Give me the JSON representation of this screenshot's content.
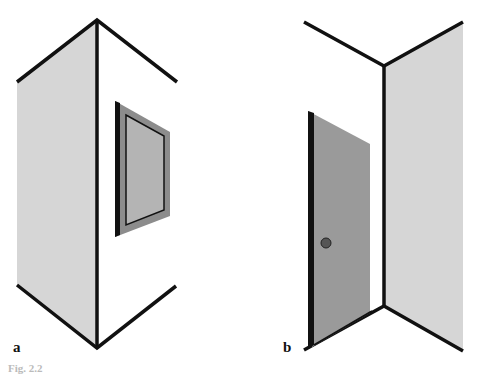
{
  "figure": {
    "panels": [
      {
        "label": "a",
        "description": "Outside corner of a wall with a picture frame hanging on the right wall"
      },
      {
        "label": "b",
        "description": "Inside corner of a room with an open door on the left"
      }
    ],
    "caption_partial": "Fig. 2.2"
  },
  "colors": {
    "line": "#111111",
    "wall_fill": "#d6d6d6",
    "frame_fill": "#8c8c8c",
    "picture_fill": "#b4b4b4",
    "door_fill": "#9a9a9a",
    "knob_fill": "#555555"
  }
}
